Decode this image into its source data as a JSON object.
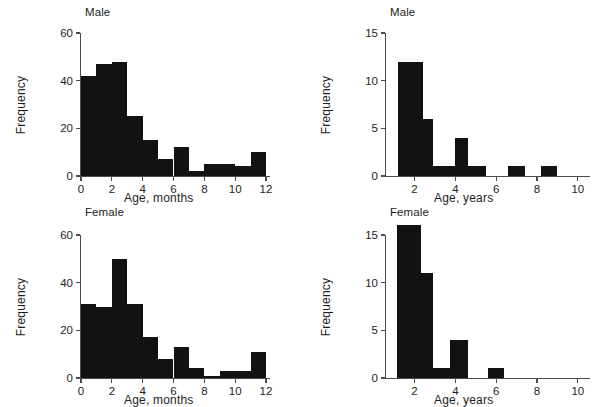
{
  "figure": {
    "kind": "histogram-panel-grid",
    "panels": 4,
    "bar_color": "#121212",
    "axis_color": "#4b4b4b",
    "background": "#ffffff"
  },
  "chart_data": [
    {
      "type": "bar",
      "panel_id": "male-months",
      "title": "Male",
      "xlabel": "Age, months",
      "ylabel": "Frequency",
      "xlim": [
        0,
        12
      ],
      "ylim": [
        0,
        60
      ],
      "xticks": [
        0,
        2,
        4,
        6,
        8,
        10,
        12
      ],
      "xtick_labels": [
        "0",
        "2",
        "4",
        "6",
        "8",
        "10",
        "12"
      ],
      "yticks": [
        0,
        20,
        40,
        60
      ],
      "ytick_labels": [
        "0",
        "20",
        "40",
        "60"
      ],
      "grid": false,
      "legend": "none",
      "bin_edges": [
        0,
        1,
        2,
        3,
        4,
        5,
        6,
        7,
        8,
        9,
        10,
        11,
        12
      ],
      "categories": [
        "0-1",
        "1-2",
        "2-3",
        "3-4",
        "4-5",
        "5-6",
        "6-7",
        "7-8",
        "8-9",
        "9-10",
        "10-11",
        "11-12"
      ],
      "values": [
        42,
        47,
        48,
        25,
        15,
        7,
        12,
        2,
        5,
        5,
        4,
        10
      ]
    },
    {
      "type": "bar",
      "panel_id": "male-years",
      "title": "Male",
      "xlabel": "Age, years",
      "ylabel": "Frequency",
      "xlim": [
        0.6,
        10.4
      ],
      "ylim": [
        0,
        15
      ],
      "xticks": [
        2,
        4,
        6,
        8,
        10
      ],
      "xtick_labels": [
        "2",
        "4",
        "6",
        "8",
        "10"
      ],
      "yticks": [
        0,
        5,
        10,
        15
      ],
      "ytick_labels": [
        "0",
        "5",
        "10",
        "15"
      ],
      "grid": false,
      "legend": "none",
      "bin_edges": [
        1.2,
        2.4,
        2.9,
        4.0,
        4.6,
        5.5,
        6.6,
        7.4,
        8.2,
        9.0
      ],
      "categories": [
        "1.2-2.4",
        "2.4-2.9",
        "2.9-4.0",
        "4.0-4.6",
        "4.6-5.5",
        "6.6-7.4",
        "8.2-9.0"
      ],
      "bars": [
        {
          "x0": 1.2,
          "x1": 2.4,
          "value": 12
        },
        {
          "x0": 2.4,
          "x1": 2.9,
          "value": 6
        },
        {
          "x0": 2.9,
          "x1": 4.0,
          "value": 1
        },
        {
          "x0": 4.0,
          "x1": 4.6,
          "value": 4
        },
        {
          "x0": 4.6,
          "x1": 5.5,
          "value": 1
        },
        {
          "x0": 6.6,
          "x1": 7.4,
          "value": 1
        },
        {
          "x0": 8.2,
          "x1": 9.0,
          "value": 1
        }
      ]
    },
    {
      "type": "bar",
      "panel_id": "female-months",
      "title": "Female",
      "xlabel": "Age, months",
      "ylabel": "Frequency",
      "xlim": [
        0,
        12
      ],
      "ylim": [
        0,
        60
      ],
      "xticks": [
        0,
        2,
        4,
        6,
        8,
        10,
        12
      ],
      "xtick_labels": [
        "0",
        "2",
        "4",
        "6",
        "8",
        "10",
        "12"
      ],
      "yticks": [
        0,
        20,
        40,
        60
      ],
      "ytick_labels": [
        "0",
        "20",
        "40",
        "60"
      ],
      "grid": false,
      "legend": "none",
      "bin_edges": [
        0,
        1,
        2,
        3,
        4,
        5,
        6,
        7,
        8,
        9,
        10,
        11,
        12
      ],
      "categories": [
        "0-1",
        "1-2",
        "2-3",
        "3-4",
        "4-5",
        "5-6",
        "6-7",
        "7-8",
        "8-9",
        "9-10",
        "10-11",
        "11-12"
      ],
      "values": [
        31,
        30,
        50,
        31,
        17,
        8,
        13,
        4,
        1,
        3,
        3,
        11
      ]
    },
    {
      "type": "bar",
      "panel_id": "female-years",
      "title": "Female",
      "xlabel": "Age, years",
      "ylabel": "Frequency",
      "xlim": [
        0.6,
        10.4
      ],
      "ylim": [
        0,
        15
      ],
      "xticks": [
        2,
        4,
        6,
        8,
        10
      ],
      "xtick_labels": [
        "2",
        "4",
        "6",
        "8",
        "10"
      ],
      "yticks": [
        0,
        5,
        10,
        15
      ],
      "ytick_labels": [
        "0",
        "5",
        "10",
        "15"
      ],
      "grid": false,
      "legend": "none",
      "bin_edges": [
        1.15,
        2.3,
        2.9,
        3.75,
        4.6,
        5.6,
        6.4
      ],
      "categories": [
        "1.15-2.3",
        "2.3-2.9",
        "2.9-3.75",
        "3.75-4.6",
        "5.6-6.4"
      ],
      "bars": [
        {
          "x0": 1.15,
          "x1": 2.3,
          "value": 16
        },
        {
          "x0": 2.3,
          "x1": 2.9,
          "value": 11
        },
        {
          "x0": 2.9,
          "x1": 3.75,
          "value": 1
        },
        {
          "x0": 3.75,
          "x1": 4.6,
          "value": 4
        },
        {
          "x0": 5.6,
          "x1": 6.4,
          "value": 1
        }
      ]
    }
  ]
}
